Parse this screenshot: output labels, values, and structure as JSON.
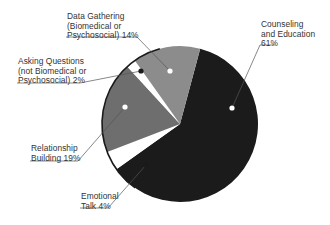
{
  "chart_data": {
    "type": "pie",
    "title": "",
    "start_angle_deg": 15,
    "direction": "clockwise",
    "slices": [
      {
        "label": "Counseling and Education",
        "value": 61,
        "color": "#1b1b1b",
        "marker": "white"
      },
      {
        "label": "Emotional Talk",
        "value": 4,
        "color": "#ffffff",
        "marker": "black"
      },
      {
        "label": "Relationship Building",
        "value": 19,
        "color": "#6e6e6e",
        "marker": "white"
      },
      {
        "label": "Asking Questions (not Biomedical or Psychosocial)",
        "value": 2,
        "color": "#ffffff",
        "marker": "black"
      },
      {
        "label": "Data Gathering (Biomedical or Psychosocial)",
        "value": 14,
        "color": "#8c8c8c",
        "marker": "white"
      }
    ],
    "legend": "callout labels with leader lines"
  },
  "labels": {
    "counseling": "Counseling\nand Education\n61%",
    "emotional": "Emotional\nTalk 4%",
    "relationship": "Relationship\nBuilding 19%",
    "asking": "Asking Questions\n(not Biomedical or\nPsychosocial) 2%",
    "data_gathering": "Data Gathering\n(Biomedical or\nPsychosocial) 14%"
  }
}
